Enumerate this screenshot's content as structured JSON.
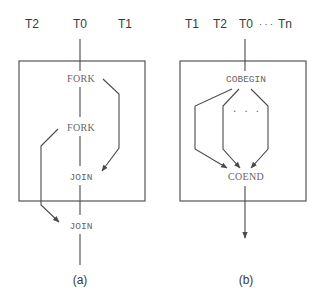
{
  "panel_a": {
    "caption": "(a)",
    "thread_labels": [
      "T2",
      "T0",
      "T1"
    ],
    "fork_1": "FORK",
    "fork_2": "FORK",
    "join_1": "JOIN",
    "join_2": "JOIN"
  },
  "panel_b": {
    "caption": "(b)",
    "thread_labels": [
      "T1",
      "T2",
      "T0"
    ],
    "ellipsis_header": "· · ·",
    "thread_last": "Tn",
    "cobegin": "COBEGIN",
    "ellipsis_middle": ". . .",
    "coend": "COEND"
  },
  "colors": {
    "line": "#4a4a4a",
    "text_dark": "#3a3a3a",
    "text_mono": "#666666",
    "background": "#ffffff"
  }
}
